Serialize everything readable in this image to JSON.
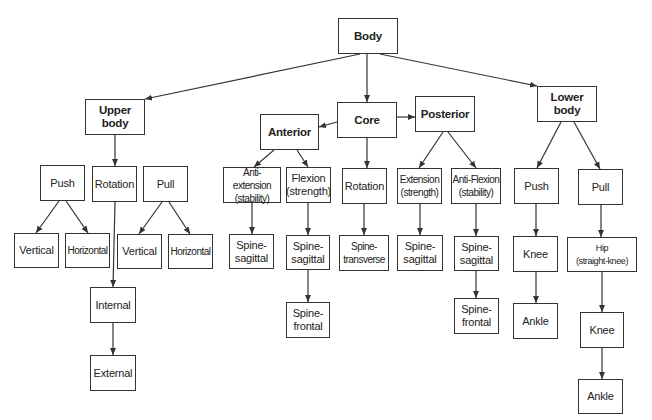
{
  "diagram": {
    "colors": {
      "line": "#333333",
      "box_border": "#333333",
      "text": "#222222",
      "background": "#ffffff"
    },
    "nodes": [
      {
        "id": "body",
        "label": "Body",
        "bold": true,
        "x": 338,
        "y": 18,
        "w": 60,
        "h": 36
      },
      {
        "id": "upper-body",
        "label": "Upper\nbody",
        "bold": true,
        "x": 85,
        "y": 99,
        "w": 60,
        "h": 36
      },
      {
        "id": "core",
        "label": "Core",
        "bold": true,
        "x": 337,
        "y": 102,
        "w": 60,
        "h": 36
      },
      {
        "id": "anterior",
        "label": "Anterior",
        "bold": true,
        "x": 260,
        "y": 114,
        "w": 59,
        "h": 36
      },
      {
        "id": "posterior",
        "label": "Posterior",
        "bold": true,
        "x": 415,
        "y": 96,
        "w": 60,
        "h": 36
      },
      {
        "id": "lower-body",
        "label": "Lower\nbody",
        "bold": true,
        "x": 537,
        "y": 86,
        "w": 60,
        "h": 36
      },
      {
        "id": "upper-push",
        "label": "Push",
        "x": 40,
        "y": 165,
        "w": 45,
        "h": 36
      },
      {
        "id": "upper-rotation",
        "label": "Rotation",
        "x": 92,
        "y": 166,
        "w": 45,
        "h": 36
      },
      {
        "id": "upper-pull",
        "label": "Pull",
        "x": 143,
        "y": 166,
        "w": 45,
        "h": 36
      },
      {
        "id": "push-vertical",
        "label": "Vertical",
        "x": 14,
        "y": 233,
        "w": 45,
        "h": 35
      },
      {
        "id": "push-horizontal",
        "label": "Horizontal",
        "small": true,
        "x": 65,
        "y": 233,
        "w": 45,
        "h": 35
      },
      {
        "id": "pull-vertical",
        "label": "Vertical",
        "x": 117,
        "y": 234,
        "w": 45,
        "h": 35
      },
      {
        "id": "pull-horizontal",
        "label": "Horizontal",
        "small": true,
        "x": 168,
        "y": 234,
        "w": 45,
        "h": 35
      },
      {
        "id": "rot-internal",
        "label": "Internal",
        "x": 90,
        "y": 287,
        "w": 46,
        "h": 36
      },
      {
        "id": "rot-external",
        "label": "External",
        "x": 90,
        "y": 355,
        "w": 46,
        "h": 36
      },
      {
        "id": "anti-extension",
        "label": "Anti-extension\n(stability)",
        "small": true,
        "x": 223,
        "y": 167,
        "w": 58,
        "h": 36
      },
      {
        "id": "flexion",
        "label": "Flexion\n(strength)",
        "x": 286,
        "y": 167,
        "w": 45,
        "h": 36
      },
      {
        "id": "core-rotation",
        "label": "Rotation",
        "x": 342,
        "y": 168,
        "w": 45,
        "h": 36
      },
      {
        "id": "extension",
        "label": "Extension\n(strength)",
        "small": true,
        "x": 397,
        "y": 168,
        "w": 45,
        "h": 36
      },
      {
        "id": "anti-flexion",
        "label": "Anti-Flexion\n(stability)",
        "small": true,
        "x": 451,
        "y": 168,
        "w": 50,
        "h": 36
      },
      {
        "id": "ae-spine-sagittal",
        "label": "Spine-\nsagittal",
        "x": 229,
        "y": 234,
        "w": 45,
        "h": 35
      },
      {
        "id": "fl-spine-sagittal",
        "label": "Spine-\nsagittal",
        "x": 286,
        "y": 235,
        "w": 44,
        "h": 35
      },
      {
        "id": "fl-spine-frontal",
        "label": "Spine-\nfrontal",
        "x": 286,
        "y": 302,
        "w": 44,
        "h": 36
      },
      {
        "id": "rot-spine-transverse",
        "label": "Spine-\ntransverse",
        "small": true,
        "x": 339,
        "y": 235,
        "w": 50,
        "h": 36
      },
      {
        "id": "ex-spine-sagittal",
        "label": "Spine-\nsagittal",
        "x": 397,
        "y": 235,
        "w": 46,
        "h": 36
      },
      {
        "id": "af-spine-sagittal",
        "label": "Spine-\nsagittal",
        "x": 454,
        "y": 236,
        "w": 45,
        "h": 35
      },
      {
        "id": "af-spine-frontal",
        "label": "Spine-\nfrontal",
        "x": 454,
        "y": 298,
        "w": 45,
        "h": 36
      },
      {
        "id": "lower-push",
        "label": "Push",
        "x": 514,
        "y": 168,
        "w": 45,
        "h": 36
      },
      {
        "id": "lower-pull",
        "label": "Pull",
        "x": 578,
        "y": 169,
        "w": 45,
        "h": 36
      },
      {
        "id": "push-knee",
        "label": "Knee",
        "x": 513,
        "y": 236,
        "w": 45,
        "h": 36
      },
      {
        "id": "push-ankle",
        "label": "Ankle",
        "x": 513,
        "y": 303,
        "w": 45,
        "h": 36
      },
      {
        "id": "pull-hip",
        "label": "Hip\n(straight-knee)",
        "tiny": true,
        "x": 567,
        "y": 237,
        "w": 70,
        "h": 35
      },
      {
        "id": "pull-knee",
        "label": "Knee",
        "x": 580,
        "y": 312,
        "w": 44,
        "h": 36
      },
      {
        "id": "pull-ankle",
        "label": "Ankle",
        "x": 578,
        "y": 379,
        "w": 45,
        "h": 35
      }
    ],
    "edges": [
      {
        "from": [
          360,
          54
        ],
        "to": [
          145,
          99
        ]
      },
      {
        "from": [
          367,
          54
        ],
        "to": [
          367,
          102
        ]
      },
      {
        "from": [
          380,
          54
        ],
        "to": [
          537,
          86
        ]
      },
      {
        "from": [
          337,
          122
        ],
        "to": [
          319,
          127
        ]
      },
      {
        "from": [
          397,
          117
        ],
        "to": [
          415,
          117
        ]
      },
      {
        "from": [
          115,
          135
        ],
        "to": [
          115,
          166
        ]
      },
      {
        "from": [
          59,
          201
        ],
        "to": [
          36,
          233
        ]
      },
      {
        "from": [
          66,
          201
        ],
        "to": [
          88,
          233
        ]
      },
      {
        "from": [
          115,
          202
        ],
        "to": [
          113,
          287
        ]
      },
      {
        "from": [
          113,
          323
        ],
        "to": [
          113,
          355
        ]
      },
      {
        "from": [
          162,
          202
        ],
        "to": [
          139,
          234
        ]
      },
      {
        "from": [
          169,
          202
        ],
        "to": [
          190,
          234
        ]
      },
      {
        "from": [
          274,
          150
        ],
        "to": [
          254,
          167
        ]
      },
      {
        "from": [
          297,
          150
        ],
        "to": [
          308,
          167
        ]
      },
      {
        "from": [
          252,
          203
        ],
        "to": [
          252,
          234
        ]
      },
      {
        "from": [
          308,
          203
        ],
        "to": [
          308,
          235
        ]
      },
      {
        "from": [
          308,
          270
        ],
        "to": [
          308,
          302
        ]
      },
      {
        "from": [
          367,
          138
        ],
        "to": [
          367,
          168
        ]
      },
      {
        "from": [
          364,
          204
        ],
        "to": [
          364,
          235
        ]
      },
      {
        "from": [
          443,
          132
        ],
        "to": [
          419,
          168
        ]
      },
      {
        "from": [
          448,
          132
        ],
        "to": [
          476,
          168
        ]
      },
      {
        "from": [
          420,
          204
        ],
        "to": [
          420,
          235
        ]
      },
      {
        "from": [
          476,
          204
        ],
        "to": [
          476,
          236
        ]
      },
      {
        "from": [
          476,
          271
        ],
        "to": [
          476,
          298
        ]
      },
      {
        "from": [
          561,
          122
        ],
        "to": [
          537,
          168
        ]
      },
      {
        "from": [
          574,
          122
        ],
        "to": [
          600,
          169
        ]
      },
      {
        "from": [
          536,
          204
        ],
        "to": [
          536,
          236
        ]
      },
      {
        "from": [
          536,
          272
        ],
        "to": [
          536,
          303
        ]
      },
      {
        "from": [
          601,
          205
        ],
        "to": [
          601,
          237
        ]
      },
      {
        "from": [
          602,
          272
        ],
        "to": [
          602,
          312
        ]
      },
      {
        "from": [
          602,
          348
        ],
        "to": [
          602,
          379
        ]
      }
    ]
  }
}
